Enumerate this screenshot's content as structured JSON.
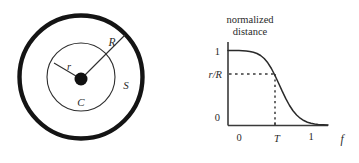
{
  "figure": {
    "background_color": "#ffffff",
    "ink_color": "#1a1a1a",
    "line_color": "#3a3a3a"
  },
  "left_diagram": {
    "name": "concentric-circles-diagram",
    "outer_circle": {
      "label": "",
      "center_x": 81,
      "center_y": 77,
      "radius": 62,
      "stroke_width": 4.4,
      "color": "#141414"
    },
    "inner_circle": {
      "center_x": 81,
      "center_y": 77,
      "radius": 34,
      "stroke_width": 1.1,
      "color": "#2e2e2e"
    },
    "center_dot": {
      "center_x": 81,
      "center_y": 79,
      "radius": 6.5,
      "color": "#111111"
    },
    "labels": {
      "outer_radius": "R",
      "inner_radius": "r",
      "center": "C",
      "annulus": "S"
    },
    "label_positions": {
      "outer_radius": {
        "x": 113,
        "y": 45
      },
      "inner_radius": {
        "x": 70,
        "y": 69
      },
      "center": {
        "x": 81,
        "y": 105
      },
      "annulus": {
        "x": 126,
        "y": 87
      }
    },
    "radius_line_R": {
      "x1": 81,
      "y1": 79,
      "x2": 125,
      "y2": 35
    },
    "radius_line_r": {
      "x1": 81,
      "y1": 79,
      "x2": 54,
      "y2": 63
    }
  },
  "chart_data": {
    "type": "line",
    "title": "normalized distance",
    "title_lines": [
      "normalized",
      "distance"
    ],
    "xlabel": "f",
    "ylabel": "",
    "xlim": [
      -0.14,
      1.4
    ],
    "ylim": [
      -0.06,
      1.12
    ],
    "x_ticks": [
      0,
      1
    ],
    "x_tick_labels": [
      "0",
      "1"
    ],
    "x_special_tick": {
      "value": 0.47,
      "label": "T"
    },
    "y_ticks": [
      0,
      1
    ],
    "y_tick_labels": [
      "0",
      "1"
    ],
    "y_special_tick": {
      "value": 0.62,
      "label": "r/R"
    },
    "grid": false,
    "legend": false,
    "series": [
      {
        "name": "normalized distance",
        "description": "logistic decay from 1 to 0 crossing r/R at f = T",
        "x": [
          0.0,
          0.05,
          0.1,
          0.15,
          0.2,
          0.25,
          0.3,
          0.35,
          0.4,
          0.45,
          0.5,
          0.55,
          0.6,
          0.65,
          0.7,
          0.75,
          0.8,
          0.85,
          0.9,
          0.95,
          1.0,
          1.05,
          1.1
        ],
        "y": [
          1.0,
          0.998,
          0.994,
          0.988,
          0.977,
          0.96,
          0.933,
          0.893,
          0.836,
          0.76,
          0.667,
          0.564,
          0.458,
          0.358,
          0.27,
          0.197,
          0.14,
          0.097,
          0.066,
          0.044,
          0.029,
          0.019,
          0.012
        ]
      }
    ],
    "annotations": [
      {
        "name": "horizontal-guide",
        "style": "dashed",
        "from": [
          0,
          0.62
        ],
        "to": [
          0.47,
          0.62
        ]
      },
      {
        "name": "vertical-guide",
        "style": "dotted",
        "from": [
          0.47,
          0.62
        ],
        "to": [
          0.47,
          0.0
        ]
      }
    ]
  }
}
